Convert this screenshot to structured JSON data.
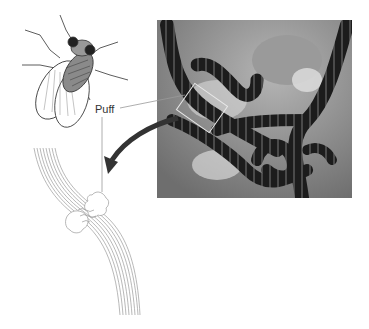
{
  "figure": {
    "label_puff": "Puff",
    "components": {
      "fly": "drosophila-fly-illustration",
      "photo": "polytene-chromosome-micrograph",
      "drawing": "chromosome-puff-line-drawing",
      "arrow": "curved-arrow-pointing-to-drawing"
    },
    "colors": {
      "line": "#999999",
      "arrow": "#333333",
      "photo_bg": "#8a8a8a",
      "chromosome": "#1a1a1a"
    }
  }
}
